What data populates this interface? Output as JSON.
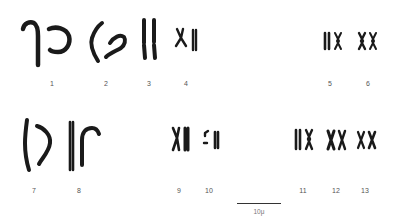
{
  "figure": {
    "type": "karyotype",
    "pairs": [
      {
        "label": "1",
        "label_x": 52,
        "label_y": 80
      },
      {
        "label": "2",
        "label_x": 106,
        "label_y": 80
      },
      {
        "label": "3",
        "label_x": 149,
        "label_y": 80
      },
      {
        "label": "4",
        "label_x": 186,
        "label_y": 80
      },
      {
        "label": "5",
        "label_x": 330,
        "label_y": 80
      },
      {
        "label": "6",
        "label_x": 368,
        "label_y": 80
      },
      {
        "label": "7",
        "label_x": 34,
        "label_y": 187
      },
      {
        "label": "8",
        "label_x": 79,
        "label_y": 187
      },
      {
        "label": "9",
        "label_x": 179,
        "label_y": 187
      },
      {
        "label": "10",
        "label_x": 209,
        "label_y": 187
      },
      {
        "label": "11",
        "label_x": 303,
        "label_y": 187
      },
      {
        "label": "12",
        "label_x": 336,
        "label_y": 187
      },
      {
        "label": "13",
        "label_x": 365,
        "label_y": 187
      }
    ],
    "scale_bar": {
      "label": "10μ",
      "x1": 237,
      "x2": 281,
      "y": 204
    },
    "chromosome_color": "#1a1a1a"
  }
}
